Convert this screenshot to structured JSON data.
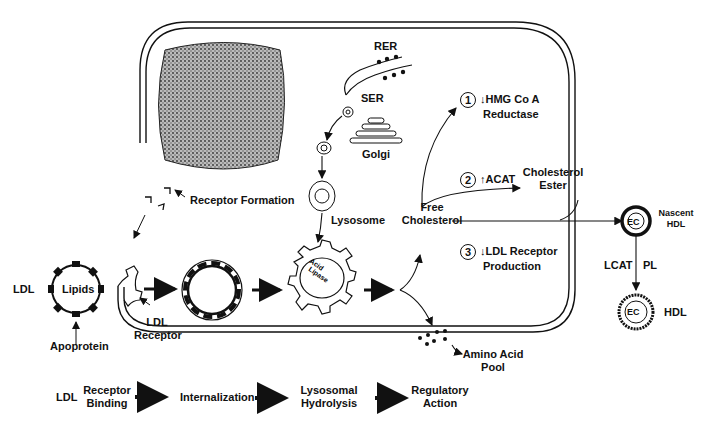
{
  "diagram": {
    "cell": {
      "organelles": {
        "rer": "RER",
        "ser": "SER",
        "golgi": "Golgi",
        "lysosome": "Lysosome",
        "acid_lipase": "Acid Lipase",
        "receptor_formation": "Receptor Formation"
      }
    },
    "ldl_particle": {
      "ldl": "LDL",
      "lipids": "Lipids",
      "apoprotein": "Apoprotein",
      "ldl_receptor": "LDL Receptor"
    },
    "products": {
      "free_cholesterol": "Free Cholesterol",
      "amino_acid_pool": "Amino Acid Pool"
    },
    "regulatory_actions": [
      {
        "num": "1",
        "arrow": "↓",
        "label_line1": "HMG Co A",
        "label_line2": "Reductase"
      },
      {
        "num": "2",
        "arrow": "↑",
        "label_line1": "ACAT",
        "target": "Cholesterol Ester"
      },
      {
        "num": "3",
        "arrow": "↓",
        "label_line1": "LDL Receptor",
        "label_line2": "Production"
      }
    ],
    "hdl": {
      "ec": "EC",
      "nascent_hdl": "Nascent HDL",
      "lcat": "LCAT",
      "pl": "PL",
      "hdl": "HDL"
    },
    "flow": {
      "ldl": "LDL",
      "steps": [
        "Receptor Binding",
        "Internalization",
        "Lysosomal Hydrolysis",
        "Regulatory Action"
      ]
    }
  }
}
